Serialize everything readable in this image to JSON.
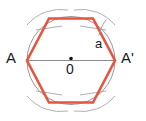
{
  "figure": {
    "background_color": "#ffffff",
    "width": 146,
    "height": 121,
    "circle": {
      "name": "circumscribed-circle",
      "cx": 71,
      "cy": 60.5,
      "r": 44,
      "stroke": "#9a9a9a",
      "stroke_width": 1,
      "fill": "none"
    },
    "diameter_line": {
      "name": "diameter-AA-prime",
      "x1": 27,
      "y1": 60.5,
      "x2": 115,
      "y2": 60.5,
      "stroke": "#8c8c8c",
      "stroke_width": 1
    },
    "center_dot": {
      "name": "center-point",
      "cx": 71,
      "cy": 58.5,
      "r": 1.8,
      "fill": "#111111"
    },
    "hexagon": {
      "name": "inscribed-hexagon",
      "stroke": "#e8543f",
      "stroke_width": 2.6,
      "fill": "none",
      "points": "27,60.5 49,18.5 93,18.5 115,60.5 93,102.5 49,102.5"
    },
    "construction_arcs": [
      {
        "name": "arc-top-left",
        "d": "M 27 25 A 44 44 0 0 1 68 10",
        "stroke": "#b0b0b0"
      },
      {
        "name": "arc-top-right",
        "d": "M 74 10 A 44 44 0 0 1 115 25",
        "stroke": "#b0b0b0"
      },
      {
        "name": "arc-bottom-left",
        "d": "M 27 96 A 44 44 0 0 0 68 111",
        "stroke": "#b0b0b0"
      },
      {
        "name": "arc-bottom-right",
        "d": "M 74 111 A 44 44 0 0 0 115 96",
        "stroke": "#b0b0b0"
      },
      {
        "name": "arc-cross-top-left",
        "d": "M 36 30 L 62 26",
        "stroke": "#b0b0b0"
      },
      {
        "name": "arc-cross-top-right",
        "d": "M 80 26 L 106 30",
        "stroke": "#b0b0b0"
      },
      {
        "name": "arc-cross-bottom-left",
        "d": "M 36 91 L 62 95",
        "stroke": "#b0b0b0"
      },
      {
        "name": "arc-cross-bottom-right",
        "d": "M 80 95 L 106 91",
        "stroke": "#b0b0b0"
      }
    ],
    "leader_line": {
      "name": "side-label-leader",
      "d": "M 99 35 C 101 28 103 24 106 20",
      "stroke": "#9a9a9a",
      "stroke_width": 1
    }
  },
  "labels": {
    "vertex_left": "A",
    "vertex_right": "A'",
    "side_length": "a",
    "center": "0"
  }
}
